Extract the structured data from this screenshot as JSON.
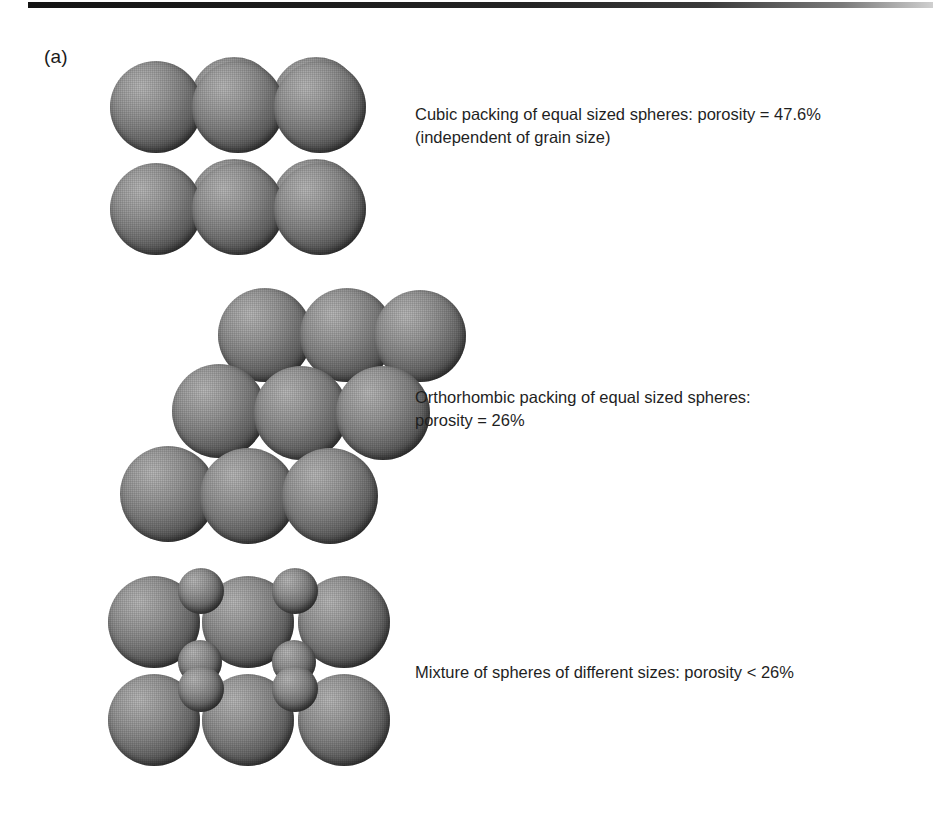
{
  "figure": {
    "panel_letter": "(a)",
    "top_rule_color": "#1a1a1a",
    "background_color": "#ffffff",
    "sphere_light_color": "#b9b9b9",
    "sphere_dark_color": "#1d1d1d"
  },
  "captions": {
    "cubic": {
      "line1": "Cubic packing of equal sized spheres: porosity = 47.6%",
      "line2": "(independent of grain size)"
    },
    "orthorhombic": {
      "line1": "Orthorhombic packing of equal sized spheres:",
      "line2": "porosity = 26%"
    },
    "mixture": {
      "line1": "Mixture of spheres of different sizes: porosity < 26%",
      "line2": ""
    }
  },
  "chart_data": {
    "type": "diagram",
    "panel": "(a)",
    "arrangements": [
      {
        "name": "Cubic packing",
        "porosity_percent": 47.6,
        "porosity_label": "47.6%",
        "comparator": "=",
        "note": "independent of grain size",
        "equal_sized": true,
        "rows": 2,
        "columns": 3,
        "sphere_count": 12,
        "sphere_sizes": [
          "large"
        ]
      },
      {
        "name": "Orthorhombic packing",
        "porosity_percent": 26,
        "porosity_label": "26%",
        "comparator": "=",
        "note": "",
        "equal_sized": true,
        "rows": 3,
        "columns": 3,
        "sphere_count": 11,
        "sphere_sizes": [
          "large"
        ]
      },
      {
        "name": "Mixture of spheres of different sizes",
        "porosity_percent": 26,
        "porosity_label": "26%",
        "comparator": "<",
        "note": "",
        "equal_sized": false,
        "rows": 2,
        "columns": 3,
        "sphere_count": 18,
        "sphere_sizes": [
          "large",
          "small"
        ]
      }
    ],
    "xlabel": "",
    "ylabel": "",
    "legend": []
  },
  "spheres": {
    "cubic": [
      {
        "x": 86,
        "y": 2,
        "d": 88
      },
      {
        "x": 168,
        "y": 2,
        "d": 88
      },
      {
        "x": 6,
        "y": 6,
        "d": 92
      },
      {
        "x": 88,
        "y": 6,
        "d": 92
      },
      {
        "x": 170,
        "y": 6,
        "d": 92
      },
      {
        "x": 86,
        "y": 104,
        "d": 88
      },
      {
        "x": 168,
        "y": 104,
        "d": 88
      },
      {
        "x": 6,
        "y": 108,
        "d": 92
      },
      {
        "x": 88,
        "y": 108,
        "d": 92
      },
      {
        "x": 170,
        "y": 108,
        "d": 92
      }
    ],
    "orthorhombic": [
      {
        "x": 98,
        "y": 0,
        "d": 94
      },
      {
        "x": 180,
        "y": 0,
        "d": 94
      },
      {
        "x": 254,
        "y": 2,
        "d": 92
      },
      {
        "x": 52,
        "y": 76,
        "d": 94
      },
      {
        "x": 134,
        "y": 78,
        "d": 94
      },
      {
        "x": 216,
        "y": 78,
        "d": 94
      },
      {
        "x": 0,
        "y": 158,
        "d": 96
      },
      {
        "x": 80,
        "y": 160,
        "d": 96
      },
      {
        "x": 162,
        "y": 160,
        "d": 96
      }
    ],
    "mixture_large": [
      {
        "x": 2,
        "y": 8,
        "d": 92
      },
      {
        "x": 96,
        "y": 8,
        "d": 92
      },
      {
        "x": 192,
        "y": 8,
        "d": 92
      },
      {
        "x": 2,
        "y": 106,
        "d": 92
      },
      {
        "x": 96,
        "y": 106,
        "d": 92
      },
      {
        "x": 192,
        "y": 106,
        "d": 92
      }
    ],
    "mixture_small": [
      {
        "x": 72,
        "y": 0,
        "d": 46
      },
      {
        "x": 166,
        "y": 0,
        "d": 46
      },
      {
        "x": 72,
        "y": 72,
        "d": 44
      },
      {
        "x": 166,
        "y": 72,
        "d": 44
      },
      {
        "x": 72,
        "y": 98,
        "d": 46
      },
      {
        "x": 166,
        "y": 98,
        "d": 46
      }
    ]
  }
}
